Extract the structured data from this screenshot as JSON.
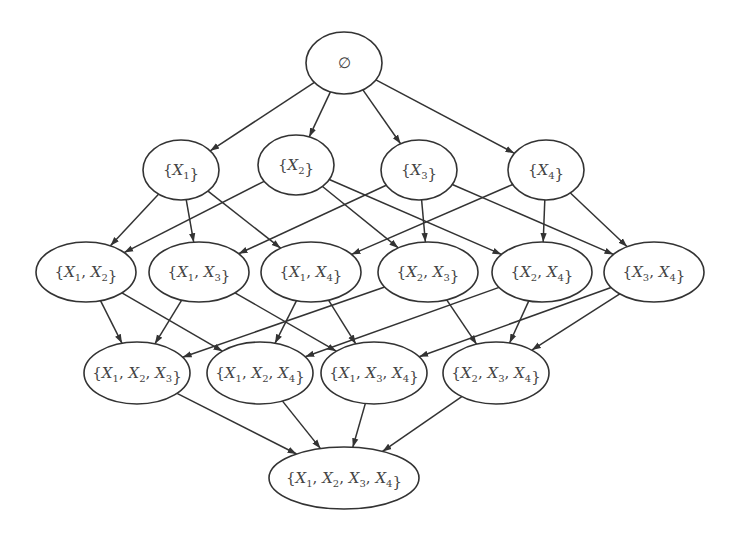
{
  "diagram": {
    "colors": {
      "stroke": "#333333",
      "fill": "#ffffff",
      "text": "#444444"
    },
    "nodes": [
      {
        "id": "empty",
        "label": "∅",
        "vars": [],
        "x": 344,
        "y": 63,
        "rx": 38,
        "ry": 31
      },
      {
        "id": "X1",
        "label": "{X1}",
        "vars": [
          1
        ],
        "x": 181,
        "y": 170,
        "rx": 38,
        "ry": 30
      },
      {
        "id": "X2",
        "label": "{X2}",
        "vars": [
          2
        ],
        "x": 296,
        "y": 165,
        "rx": 38,
        "ry": 30
      },
      {
        "id": "X3",
        "label": "{X3}",
        "vars": [
          3
        ],
        "x": 419,
        "y": 170,
        "rx": 38,
        "ry": 30
      },
      {
        "id": "X4",
        "label": "{X4}",
        "vars": [
          4
        ],
        "x": 546,
        "y": 170,
        "rx": 38,
        "ry": 30
      },
      {
        "id": "X1X2",
        "label": "{X1, X2}",
        "vars": [
          1,
          2
        ],
        "x": 86,
        "y": 272,
        "rx": 50,
        "ry": 30
      },
      {
        "id": "X1X3",
        "label": "{X1, X3}",
        "vars": [
          1,
          3
        ],
        "x": 199,
        "y": 272,
        "rx": 50,
        "ry": 30
      },
      {
        "id": "X1X4",
        "label": "{X1, X4}",
        "vars": [
          1,
          4
        ],
        "x": 311,
        "y": 272,
        "rx": 50,
        "ry": 30
      },
      {
        "id": "X2X3",
        "label": "{X2, X3}",
        "vars": [
          2,
          3
        ],
        "x": 428,
        "y": 272,
        "rx": 50,
        "ry": 30
      },
      {
        "id": "X2X4",
        "label": "{X2, X4}",
        "vars": [
          2,
          4
        ],
        "x": 542,
        "y": 272,
        "rx": 50,
        "ry": 30
      },
      {
        "id": "X3X4",
        "label": "{X3, X4}",
        "vars": [
          3,
          4
        ],
        "x": 654,
        "y": 272,
        "rx": 50,
        "ry": 30
      },
      {
        "id": "X1X2X3",
        "label": "{X1, X2, X3}",
        "vars": [
          1,
          2,
          3
        ],
        "x": 137,
        "y": 373,
        "rx": 53,
        "ry": 31
      },
      {
        "id": "X1X2X4",
        "label": "{X1, X2, X4}",
        "vars": [
          1,
          2,
          4
        ],
        "x": 260,
        "y": 373,
        "rx": 53,
        "ry": 31
      },
      {
        "id": "X1X3X4",
        "label": "{X1, X3, X4}",
        "vars": [
          1,
          3,
          4
        ],
        "x": 374,
        "y": 373,
        "rx": 53,
        "ry": 31
      },
      {
        "id": "X2X3X4",
        "label": "{X2, X3, X4}",
        "vars": [
          2,
          3,
          4
        ],
        "x": 496,
        "y": 373,
        "rx": 53,
        "ry": 31
      },
      {
        "id": "X1X2X3X4",
        "label": "{X1, X2, X3, X4}",
        "vars": [
          1,
          2,
          3,
          4
        ],
        "x": 344,
        "y": 478,
        "rx": 75,
        "ry": 31
      }
    ],
    "edges": [
      [
        "empty",
        "X1"
      ],
      [
        "empty",
        "X2"
      ],
      [
        "empty",
        "X3"
      ],
      [
        "empty",
        "X4"
      ],
      [
        "X1",
        "X1X2"
      ],
      [
        "X1",
        "X1X3"
      ],
      [
        "X1",
        "X1X4"
      ],
      [
        "X2",
        "X1X2"
      ],
      [
        "X2",
        "X2X3"
      ],
      [
        "X2",
        "X2X4"
      ],
      [
        "X3",
        "X1X3"
      ],
      [
        "X3",
        "X2X3"
      ],
      [
        "X3",
        "X3X4"
      ],
      [
        "X4",
        "X1X4"
      ],
      [
        "X4",
        "X2X4"
      ],
      [
        "X4",
        "X3X4"
      ],
      [
        "X1X2",
        "X1X2X3"
      ],
      [
        "X1X2",
        "X1X2X4"
      ],
      [
        "X1X3",
        "X1X2X3"
      ],
      [
        "X1X3",
        "X1X3X4"
      ],
      [
        "X1X4",
        "X1X2X4"
      ],
      [
        "X1X4",
        "X1X3X4"
      ],
      [
        "X2X3",
        "X1X2X3"
      ],
      [
        "X2X3",
        "X2X3X4"
      ],
      [
        "X2X4",
        "X1X2X4"
      ],
      [
        "X2X4",
        "X2X3X4"
      ],
      [
        "X3X4",
        "X1X3X4"
      ],
      [
        "X3X4",
        "X2X3X4"
      ],
      [
        "X1X2X3",
        "X1X2X3X4"
      ],
      [
        "X1X2X4",
        "X1X2X3X4"
      ],
      [
        "X1X3X4",
        "X1X2X3X4"
      ],
      [
        "X2X3X4",
        "X1X2X3X4"
      ]
    ]
  }
}
